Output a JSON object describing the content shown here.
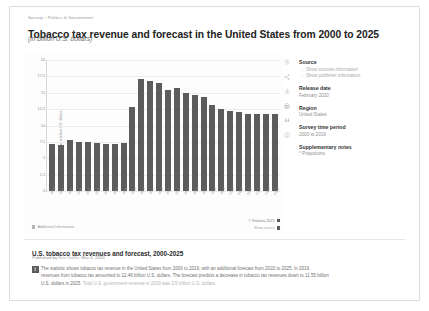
{
  "breadcrumb": {
    "root": "Society",
    "section": "Politics & Government",
    "separator": "›"
  },
  "header": {
    "title": "Tobacco tax revenue and forecast in the United States from 2000 to 2025",
    "subtitle": "(in billion U.S. dollars)"
  },
  "chart_footer": {
    "additional_information": "Additional Information",
    "copyright": "© Statista 2021",
    "show_source": "Show source"
  },
  "icon_rail": [
    {
      "name": "settings-icon",
      "glyph": "gear"
    },
    {
      "name": "share-icon",
      "glyph": "share"
    },
    {
      "name": "download-icon",
      "glyph": "download"
    },
    {
      "name": "print-icon",
      "glyph": "print"
    },
    {
      "name": "citation-icon",
      "glyph": "quote"
    },
    {
      "name": "info-icon",
      "glyph": "info"
    }
  ],
  "sidebar": {
    "source": {
      "heading": "Source",
      "links": [
        {
          "label": "Show sources information",
          "arrow": "→"
        },
        {
          "label": "Show publisher information",
          "arrow": "→"
        }
      ]
    },
    "release_date": {
      "heading": "Release date",
      "value": "February 2020"
    },
    "region": {
      "heading": "Region",
      "value": "United States"
    },
    "survey_time_period": {
      "heading": "Survey time period",
      "value": "2000 to 2019"
    },
    "supplementary_notes": {
      "heading": "Supplementary notes",
      "value": "* Projections."
    }
  },
  "description": {
    "title": "U.S. tobacco tax revenues and forecast, 2000-2025",
    "published_prefix": "Published by",
    "author": "Erin Duffin",
    "date": "Mar 4, 2020",
    "badge": "i",
    "body_1": "The statistic shows tobacco tax revenue in the United States from 2000 to 2019, with an additional forecast from 2020 to 2025. In 2019, revenues from tobacco tax amounted to 12.46 billion U.S. dollars. The forecast predicts a decrease in tobacco tax revenues down to 11.55 billion U.S. dollars in 2025.",
    "body_2": "Total U.S. government revenue in 2019 was 3.5 trillion U.S. dollars."
  },
  "chart_data": {
    "type": "bar",
    "title": "Tobacco tax revenue and forecast in the United States from 2000 to 2025",
    "subtitle": "(in billion U.S. dollars)",
    "xlabel": "",
    "ylabel": "Tobacco tax revenue in billion U.S. dollars",
    "ylim": [
      0,
      20
    ],
    "yticks": [
      20,
      17.5,
      15,
      12.5,
      10,
      7.5,
      5,
      2.5,
      0
    ],
    "grid": true,
    "legend": false,
    "bar_color": "#5c5c5c",
    "categories": [
      "2000",
      "2001",
      "2002",
      "2003",
      "2004",
      "2005",
      "2006",
      "2007",
      "2008",
      "2009",
      "2010",
      "2011",
      "2012",
      "2013",
      "2014",
      "2015",
      "2016",
      "2017",
      "2018",
      "2019",
      "2020*",
      "2021*",
      "2022*",
      "2023*",
      "2024*",
      "2025*"
    ],
    "values": [
      7.21,
      7.07,
      7.76,
      7.42,
      7.43,
      7.39,
      7.15,
      7.15,
      7.39,
      12.89,
      17.16,
      16.85,
      16.51,
      15.36,
      15.77,
      14.89,
      14.59,
      14.29,
      13.11,
      12.46,
      12.23,
      11.99,
      11.81,
      11.73,
      11.71,
      11.7
    ]
  }
}
